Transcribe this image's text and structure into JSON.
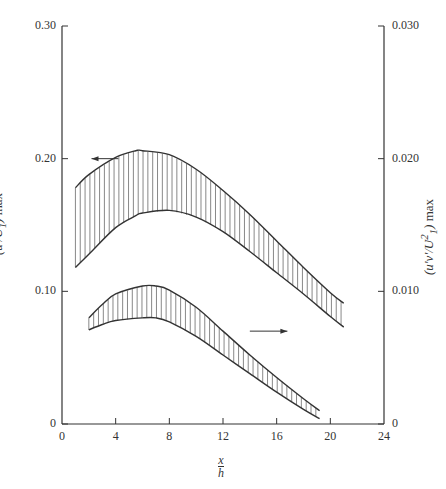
{
  "chart_data": {
    "type": "area",
    "title": "",
    "xlabel": "x/h",
    "ylabel_left": "(u'/U1) max",
    "ylabel_right": "(u'v'/U1^2) max",
    "xlim": [
      0,
      24
    ],
    "ylim_left": [
      0,
      0.3
    ],
    "ylim_right": [
      0,
      0.03
    ],
    "x_ticks": [
      "0",
      "4",
      "8",
      "12",
      "16",
      "20",
      "24"
    ],
    "y_ticks_left": [
      "0",
      "0.10",
      "0.20",
      "0.30"
    ],
    "y_ticks_right": [
      "0",
      "0.010",
      "0.020",
      "0.030"
    ],
    "grid": false,
    "legend": "arrows indicate axis: upper band → left axis, lower band → right axis",
    "series": [
      {
        "name": "u'/U1 max (band, left axis)",
        "axis": "left",
        "x": [
          1,
          2,
          4,
          5.5,
          6,
          8,
          10,
          12,
          14,
          16,
          18,
          20,
          21
        ],
        "upper": [
          0.178,
          0.188,
          0.201,
          0.206,
          0.206,
          0.203,
          0.192,
          0.176,
          0.158,
          0.138,
          0.118,
          0.099,
          0.091
        ],
        "lower": [
          0.118,
          0.128,
          0.148,
          0.157,
          0.159,
          0.161,
          0.156,
          0.145,
          0.13,
          0.114,
          0.098,
          0.081,
          0.073
        ]
      },
      {
        "name": "u'v'/U1^2 max (band, right axis)",
        "axis": "right",
        "x": [
          2,
          3,
          4,
          6,
          7,
          8,
          10,
          12,
          14,
          16,
          18,
          19.2
        ],
        "upper": [
          0.008,
          0.009,
          0.0098,
          0.0104,
          0.0104,
          0.0101,
          0.0088,
          0.007,
          0.0052,
          0.0035,
          0.0019,
          0.001
        ],
        "lower": [
          0.0071,
          0.0075,
          0.0078,
          0.008,
          0.008,
          0.0077,
          0.0066,
          0.0052,
          0.0038,
          0.0024,
          0.0011,
          0.0004
        ]
      }
    ]
  },
  "labels": {
    "xlabel_num": "x",
    "xlabel_den": "h",
    "left_num": "u'",
    "left_den": "U",
    "left_sub": "1",
    "left_suffix": "max",
    "right_num": "u'v'",
    "right_den": "U",
    "right_sup": "2",
    "right_sub": "1",
    "right_suffix": "max"
  }
}
